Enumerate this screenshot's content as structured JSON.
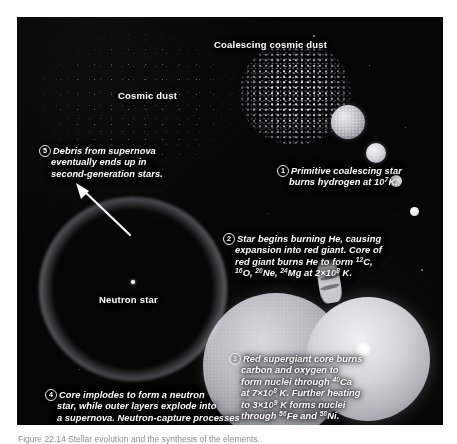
{
  "figure": {
    "panel_background": "#050505",
    "text_color": "#ffffff",
    "caption": "Figure 22.14   Stellar evolution and the synthesis of the elements."
  },
  "labels": {
    "coalescing_dust": "Coalescing cosmic dust",
    "cosmic_dust": "Cosmic dust",
    "neutron_star": "Neutron star"
  },
  "callouts": [
    {
      "number": "1",
      "lines": [
        "Primitive coalescing star",
        "burns hydrogen at 10⁷K."
      ],
      "text": "Primitive coalescing star burns hydrogen at 10⁷K."
    },
    {
      "number": "2",
      "lines": [
        "Star begins burning He, causing",
        "expansion into red giant. Core of",
        "red giant burns He to form ¹²C,",
        "¹⁶O, ²⁰Ne, ²⁴Mg at 2×10⁸ K."
      ],
      "text": "Star begins burning He, causing expansion into red giant. Core of red giant burns He to form 12C, 16O, 20Ne, 24Mg at 2×108 K."
    },
    {
      "number": "3",
      "lines": [
        "Red supergiant core burns",
        "carbon and oxygen to",
        "form nuclei through ⁴⁰Ca",
        "at 7×10⁸ K. Further heating",
        "to 3×10⁹ K forms nuclei",
        "through ⁵⁶Fe and ⁵⁸Ni."
      ],
      "text": "Red supergiant core burns carbon and oxygen to form nuclei through 40Ca at 7×108 K. Further heating to 3×109 K forms nuclei through 56Fe and 58Ni."
    },
    {
      "number": "4",
      "lines": [
        "Core implodes to form a neutron",
        "star, while outer layers explode into",
        "a supernova. Neutron-capture processes",
        "form heavier nuclei."
      ],
      "text": "Core implodes to form a neutron star, while outer layers explode into a supernova. Neutron-capture processes form heavier nuclei."
    },
    {
      "number": "5",
      "lines": [
        "Debris from supernova",
        "eventually ends up in",
        "second-generation stars."
      ],
      "text": "Debris from supernova eventually ends up in second-generation stars."
    }
  ],
  "objects": {
    "protostar_chain": [
      "protostar-large",
      "protostar-medium",
      "protostar-small",
      "protostar-tiny"
    ],
    "red_giant": "red-giant-sphere",
    "red_supergiant": "red-supergiant-sphere",
    "supernova_remnant": "supernova-ring",
    "neutron_star_point": "neutron-star-dot"
  }
}
